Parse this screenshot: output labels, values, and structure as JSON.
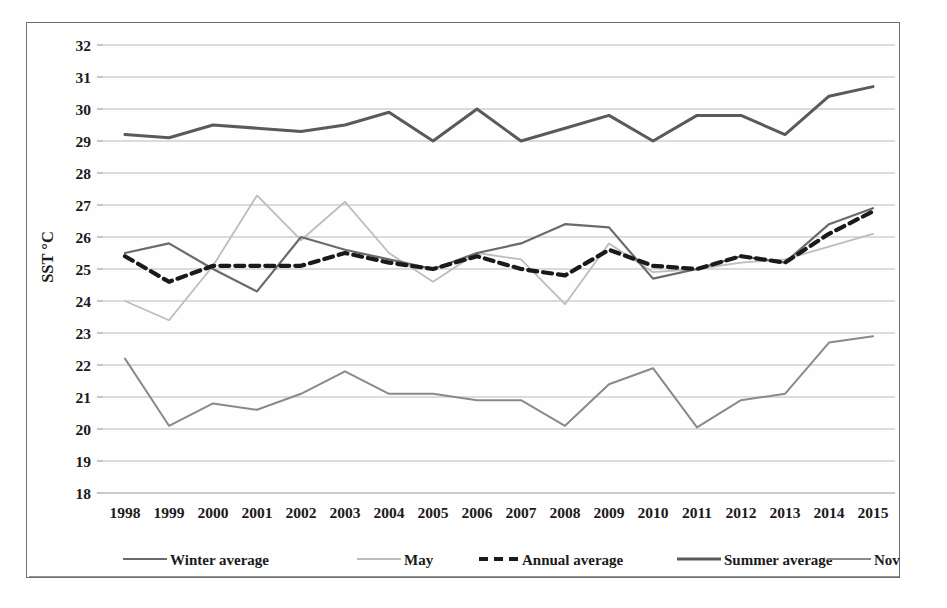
{
  "figure": {
    "ylabel": "SST °C",
    "xlabel": "",
    "frame_color": "#6e6e6e"
  },
  "legend": {
    "position": "bottom",
    "items": [
      {
        "label": "Winter average",
        "color": "#6a6a6a",
        "style": "solid",
        "width": 2.2
      },
      {
        "label": "May",
        "color": "#bdbdbd",
        "style": "solid",
        "width": 1.8
      },
      {
        "label": "Annual average",
        "color": "#1a1a1a",
        "style": "dashed",
        "width": 4.2
      },
      {
        "label": "Summer average",
        "color": "#5a5a5a",
        "style": "solid",
        "width": 3.0
      },
      {
        "label": "Nov",
        "color": "#8a8a8a",
        "style": "solid",
        "width": 2.0
      }
    ]
  },
  "chart_data": {
    "type": "line",
    "title": "",
    "xlabel": "",
    "ylabel": "SST °C",
    "ylim": [
      18,
      32
    ],
    "ytick_step": 1,
    "yticks": [
      18,
      19,
      20,
      21,
      22,
      23,
      24,
      25,
      26,
      27,
      28,
      29,
      30,
      31,
      32
    ],
    "grid": true,
    "legend_position": "bottom",
    "categories": [
      "1998",
      "1999",
      "2000",
      "2001",
      "2002",
      "2003",
      "2004",
      "2005",
      "2006",
      "2007",
      "2008",
      "2009",
      "2010",
      "2011",
      "2012",
      "2013",
      "2014",
      "2015"
    ],
    "series": [
      {
        "name": "Winter average",
        "color": "#6a6a6a",
        "style": "solid",
        "values": [
          25.5,
          25.8,
          25.0,
          24.3,
          26.0,
          25.6,
          25.3,
          25.0,
          25.5,
          25.8,
          26.4,
          26.3,
          24.7,
          25.0,
          25.4,
          25.2,
          26.4,
          26.9
        ]
      },
      {
        "name": "May",
        "color": "#bdbdbd",
        "style": "solid",
        "values": [
          24.0,
          23.4,
          25.1,
          27.3,
          25.9,
          27.1,
          25.5,
          24.6,
          25.5,
          25.3,
          23.9,
          25.8,
          24.9,
          25.0,
          25.2,
          25.3,
          25.7,
          26.1
        ]
      },
      {
        "name": "Annual average",
        "color": "#1a1a1a",
        "style": "dashed",
        "values": [
          25.4,
          24.6,
          25.1,
          25.1,
          25.1,
          25.5,
          25.2,
          25.0,
          25.4,
          25.0,
          24.8,
          25.6,
          25.1,
          25.0,
          25.4,
          25.2,
          26.1,
          26.8
        ]
      },
      {
        "name": "Summer average",
        "color": "#5a5a5a",
        "style": "solid",
        "values": [
          29.2,
          29.1,
          29.5,
          29.4,
          29.3,
          29.5,
          29.9,
          29.0,
          30.0,
          29.0,
          29.4,
          29.8,
          29.0,
          29.8,
          29.8,
          29.2,
          30.4,
          30.7
        ]
      },
      {
        "name": "Nov",
        "color": "#8a8a8a",
        "style": "solid",
        "values": [
          22.2,
          20.1,
          20.8,
          20.6,
          21.1,
          21.8,
          21.1,
          21.1,
          20.9,
          20.9,
          20.1,
          21.4,
          21.9,
          20.05,
          20.9,
          21.1,
          22.7,
          22.9
        ]
      }
    ]
  }
}
